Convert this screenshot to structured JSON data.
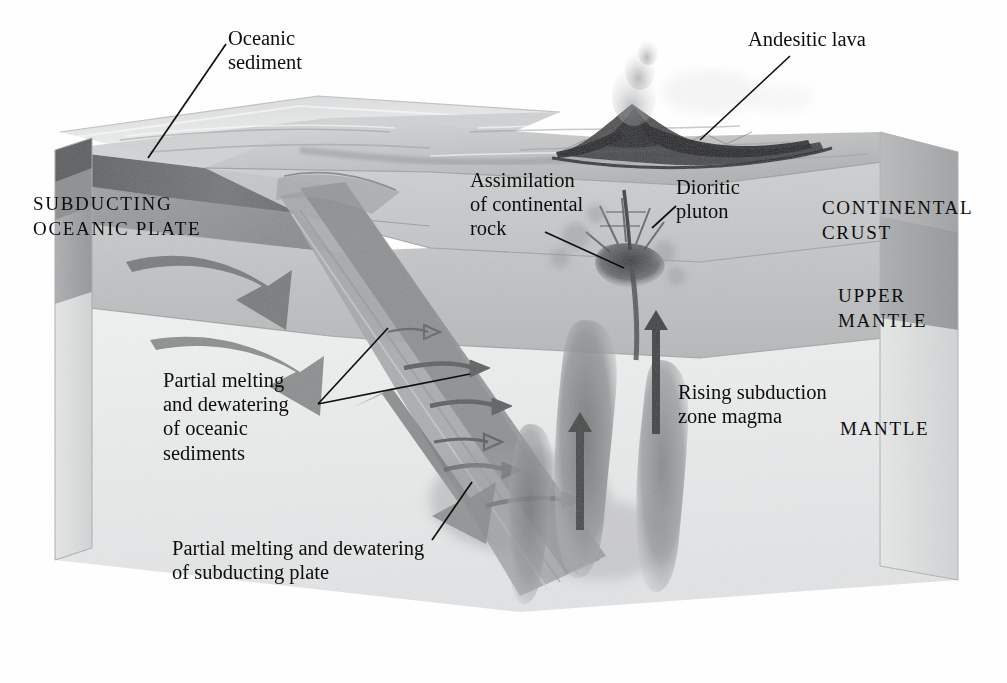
{
  "figure": {
    "type": "block-diagram",
    "style": "grayscale airbrush geological illustration",
    "width": 1007,
    "height": 683
  },
  "labels": {
    "oceanic_sediment": "Oceanic\nsediment",
    "andesitic_lava": "Andesitic lava",
    "assimilation": "Assimilation\nof continental\nrock",
    "dioritic_pluton": "Dioritic\npluton",
    "continental_crust": "CONTINENTAL\nCRUST",
    "upper_mantle": "UPPER\nMANTLE",
    "mantle": "MANTLE",
    "rising_magma": "Rising subduction\nzone magma",
    "subducting_plate": "SUBDUCTING\nOCEANIC PLATE",
    "partial_melting_sediments": "Partial melting\nand dewatering\nof oceanic\nsediments",
    "partial_melting_slab": "Partial melting and dewatering\nof subducting plate"
  },
  "layers": [
    {
      "name": "ocean-water",
      "label": "",
      "tone": "#d7d9da"
    },
    {
      "name": "oceanic-sediment",
      "label": "Oceanic sediment",
      "tone": "#6f7173"
    },
    {
      "name": "oceanic-crust",
      "label": "Subducting oceanic plate",
      "tone": "#9a9c9e"
    },
    {
      "name": "continental-crust",
      "label": "CONTINENTAL CRUST",
      "tone": "#c3c5c6"
    },
    {
      "name": "upper-mantle",
      "label": "UPPER MANTLE",
      "tone": "#b4b6b8"
    },
    {
      "name": "mantle",
      "label": "MANTLE",
      "tone": "#eceded"
    }
  ],
  "features": [
    {
      "name": "volcano",
      "label": "Andesitic lava"
    },
    {
      "name": "ash-plume",
      "label": ""
    },
    {
      "name": "dioritic-pluton",
      "label": "Dioritic pluton"
    },
    {
      "name": "magma-diapir",
      "label": "Rising subduction zone magma",
      "count": 3
    },
    {
      "name": "subduction-arrow",
      "label": "",
      "count": 3
    },
    {
      "name": "dewatering-arrow",
      "label": "Partial melting and dewatering",
      "count": 6
    },
    {
      "name": "trench",
      "label": ""
    }
  ],
  "colors": {
    "ink": "#0d0d0d",
    "background": "#fefefe",
    "sediment_dark": "#6a6c6e",
    "slab_mid": "#8e9092",
    "crust_light": "#c8cacb",
    "mantle_pale": "#ededee"
  }
}
